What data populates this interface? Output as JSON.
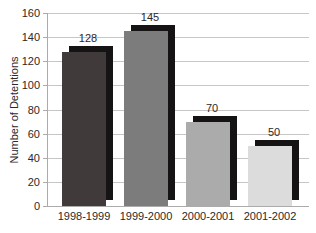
{
  "chart_data": {
    "type": "bar",
    "title": "",
    "xlabel": "",
    "ylabel": "Number of Detentions",
    "categories": [
      "1998-1999",
      "1999-2000",
      "2000-2001",
      "2001-2002"
    ],
    "values": [
      128,
      145,
      70,
      50
    ],
    "value_labels": [
      "128",
      "145",
      "70",
      "50"
    ],
    "ylim": [
      0,
      160
    ],
    "ytick_step": 20,
    "yticks": [
      "160",
      "140",
      "120",
      "100",
      "80",
      "60",
      "40",
      "20",
      "0"
    ],
    "grid": "horizontal gridlines on",
    "legend_position": "none",
    "bar_colors": [
      "#403a3a",
      "#7c7c7c",
      "#ababab",
      "#dcdcdc"
    ],
    "shadow_color": "#151313",
    "gridline_color": "#c6c6c6",
    "axis_color": "#ababab",
    "text_color": "#2d2829",
    "background_color": "#ffffff"
  }
}
